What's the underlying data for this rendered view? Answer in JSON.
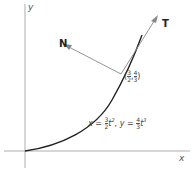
{
  "diagram": {
    "axes": {
      "x_label": "x",
      "y_label": "y"
    },
    "vectors": {
      "tangent_label": "T",
      "normal_label": "N"
    },
    "point": {
      "x_num": "3",
      "x_den": "2",
      "y_num": "4",
      "y_den": "3",
      "open": "(",
      "comma": ",",
      "close": ")"
    },
    "equation": {
      "x_part": "x = ",
      "x_num": "3",
      "x_den": "2",
      "x_tail": "t",
      "x_exp": "2",
      "sep": ",  ",
      "y_part": "y = ",
      "y_num": "4",
      "y_den": "3",
      "y_tail": "t",
      "y_exp": "3"
    },
    "colors": {
      "curve": "#222222",
      "vector": "#888888",
      "axis": "#999999"
    }
  }
}
